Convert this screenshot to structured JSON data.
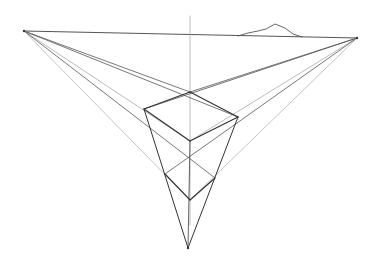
{
  "colors": {
    "background": "#ffffff",
    "stroke": "#555555",
    "stroke_light": "#aaaaaa",
    "stroke_dark": "#333333"
  },
  "vanishing_points": {
    "left": [
      24,
      31
    ],
    "right": [
      357,
      38
    ],
    "bottom": [
      188,
      248
    ]
  },
  "horizon_line": {
    "x1": 24,
    "y1": 31,
    "x2": 357,
    "y2": 38
  },
  "vertical_guide": {
    "x": 190,
    "y1": 16,
    "y2": 225
  },
  "box": {
    "top_back": [
      190,
      92
    ],
    "top_left": [
      144,
      109
    ],
    "top_right": [
      238,
      117
    ],
    "top_front": [
      190,
      141
    ],
    "bottom_left": [
      165,
      174
    ],
    "bottom_right": [
      215,
      178
    ],
    "bottom_front": [
      190,
      200
    ]
  },
  "mountain": [
    [
      238,
      36
    ],
    [
      248,
      33
    ],
    [
      258,
      31
    ],
    [
      266,
      29
    ],
    [
      275,
      24
    ],
    [
      285,
      28
    ],
    [
      293,
      34
    ],
    [
      302,
      37
    ]
  ]
}
